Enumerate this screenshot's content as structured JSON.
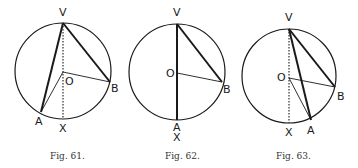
{
  "figures": [
    {
      "id": "fig61",
      "caption": "Fig. 61.",
      "labels": {
        "V": "V",
        "O": "O",
        "A": "A",
        "B": "B",
        "X": "X"
      },
      "circle": {
        "cx": 63,
        "cy": 71,
        "r": 48
      },
      "points": {
        "V": [
          63,
          23
        ],
        "O": [
          63,
          72
        ],
        "A": [
          41,
          112
        ],
        "B": [
          110,
          82
        ],
        "X": [
          63,
          119
        ]
      },
      "description": "Inscribed angle AVB with A and B on opposite sides of diameter VX"
    },
    {
      "id": "fig62",
      "caption": "Fig. 62.",
      "labels": {
        "V": "V",
        "O": "O",
        "A": "A",
        "B": "B",
        "X": "X"
      },
      "circle": {
        "cx": 177,
        "cy": 72,
        "r": 48
      },
      "points": {
        "V": [
          177,
          24
        ],
        "O": [
          177,
          73
        ],
        "A": [
          177,
          120
        ],
        "B": [
          222,
          82
        ],
        "X": [
          177,
          120
        ]
      },
      "description": "Inscribed angle AVB with side VA being the diameter VX"
    },
    {
      "id": "fig63",
      "caption": "Fig. 63.",
      "labels": {
        "V": "V",
        "O": "O",
        "A": "A",
        "B": "B",
        "X": "X"
      },
      "circle": {
        "cx": 289,
        "cy": 76,
        "r": 47
      },
      "points": {
        "V": [
          289,
          29
        ],
        "O": [
          289,
          78
        ],
        "A": [
          311,
          120
        ],
        "B": [
          335,
          87
        ],
        "X": [
          289,
          123
        ]
      },
      "description": "Inscribed angle AVB with A and B on the same side of diameter VX"
    }
  ],
  "colors": {
    "ink": "#1a1a1a",
    "caption": "#333333",
    "background": "#ffffff"
  }
}
